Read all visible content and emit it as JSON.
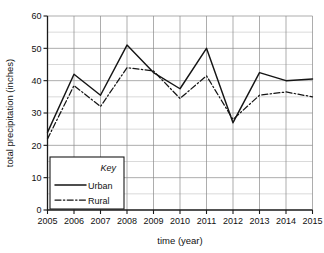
{
  "chart_data": {
    "type": "line",
    "title": "",
    "xlabel": "time (year)",
    "ylabel": "total precipitation (inches)",
    "x": [
      2005,
      2006,
      2007,
      2008,
      2009,
      2010,
      2011,
      2012,
      2013,
      2014,
      2015
    ],
    "categories": [
      "2005",
      "2006",
      "2007",
      "2008",
      "2009",
      "2010",
      "2011",
      "2012",
      "2013",
      "2014",
      "2015"
    ],
    "series": [
      {
        "name": "Urban",
        "style": "solid",
        "values": [
          24,
          42,
          35.5,
          51,
          42.5,
          37.5,
          50,
          27,
          42.5,
          40,
          40.5
        ]
      },
      {
        "name": "Rural",
        "style": "dash-dot",
        "values": [
          22,
          38.5,
          32,
          44,
          43,
          34.5,
          41.5,
          28,
          35.5,
          36.5,
          35
        ]
      }
    ],
    "ylim": [
      0,
      60
    ],
    "xlim": [
      2005,
      2015
    ],
    "y_ticks": [
      0,
      10,
      20,
      30,
      40,
      50,
      60
    ],
    "y_tick_labels": [
      "0",
      "10",
      "20",
      "30",
      "40",
      "50",
      "60"
    ],
    "y_minor_step": 5,
    "grid": true,
    "legend_position": "inside-lower-left",
    "legend_title": "Key",
    "colors": {
      "urban": "#151515",
      "rural": "#151515",
      "grid_major": "#8a8a8a",
      "grid_minor": "#b5b5b5",
      "axis": "#1a1a1a",
      "background": "#ffffff"
    }
  }
}
